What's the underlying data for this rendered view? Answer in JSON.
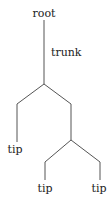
{
  "diagram": {
    "type": "tree",
    "colors": {
      "line": "#555555",
      "text": "#222222",
      "background": "#ffffff"
    },
    "labels": {
      "root": "root",
      "trunk": "trunk",
      "tip_left": "tip",
      "tip_mid": "tip",
      "tip_right": "tip"
    },
    "nodes": [
      {
        "id": "root",
        "label": "root"
      },
      {
        "id": "branch1",
        "label": ""
      },
      {
        "id": "leaf1",
        "label": "tip"
      },
      {
        "id": "branch2",
        "label": ""
      },
      {
        "id": "leaf2",
        "label": "tip"
      },
      {
        "id": "leaf3",
        "label": "tip"
      }
    ],
    "edges": [
      {
        "from": "root",
        "to": "branch1",
        "label": "trunk"
      },
      {
        "from": "branch1",
        "to": "leaf1"
      },
      {
        "from": "branch1",
        "to": "branch2"
      },
      {
        "from": "branch2",
        "to": "leaf2"
      },
      {
        "from": "branch2",
        "to": "leaf3"
      }
    ]
  }
}
